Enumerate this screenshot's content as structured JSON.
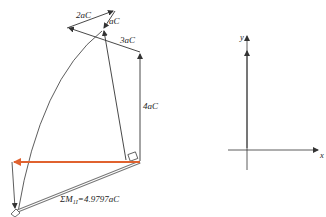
{
  "colors": {
    "line": "#333333",
    "resultant": "#e0622f",
    "double": "#888888"
  },
  "left_polygon": {
    "labels": {
      "v2aC": "2aC",
      "vaC": "aC",
      "v3aC": "3aC",
      "v4aC": "4aC",
      "sum": "ΣM",
      "sum_sub": "1I",
      "sum_value": "=4.9797aC"
    }
  },
  "right_polygon": {
    "axes": {
      "x": "x",
      "y": "y"
    },
    "labels": {
      "v3alC": "3aλC",
      "v4alC": "4aλC",
      "valC": "aλC",
      "v2alC": "2aλC",
      "sum": "ΣM",
      "sum_sub": "1II",
      "sum_value": "=0.449λaC"
    }
  }
}
